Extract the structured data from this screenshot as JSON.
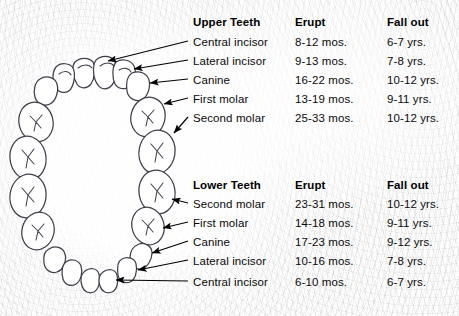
{
  "meta": {
    "colors": {
      "text": "#000000",
      "tooth_outline": "#3a3a46",
      "arrow": "#000000",
      "background": "#fdfdfd"
    }
  },
  "upper": {
    "headers": {
      "teeth": "Upper Teeth",
      "erupt": "Erupt",
      "fall_out": "Fall out"
    },
    "rows": [
      {
        "tooth": "Central incisor",
        "erupt": "8-12 mos.",
        "fall_out": "6-7 yrs."
      },
      {
        "tooth": "Lateral incisor",
        "erupt": "9-13 mos.",
        "fall_out": "7-8 yrs."
      },
      {
        "tooth": "Canine",
        "erupt": "16-22 mos.",
        "fall_out": "10-12 yrs."
      },
      {
        "tooth": "First molar",
        "erupt": "13-19 mos.",
        "fall_out": "9-11 yrs."
      },
      {
        "tooth": "Second molar",
        "erupt": "25-33 mos.",
        "fall_out": "10-12 yrs."
      }
    ]
  },
  "lower": {
    "headers": {
      "teeth": "Lower Teeth",
      "erupt": "Erupt",
      "fall_out": "Fall out"
    },
    "rows": [
      {
        "tooth": "Second molar",
        "erupt": "23-31 mos.",
        "fall_out": "10-12 yrs."
      },
      {
        "tooth": "First molar",
        "erupt": "14-18 mos.",
        "fall_out": "9-11 yrs."
      },
      {
        "tooth": "Canine",
        "erupt": "17-23 mos.",
        "fall_out": "9-12 yrs."
      },
      {
        "tooth": "Lateral incisor",
        "erupt": "10-16 mos.",
        "fall_out": "7-8 yrs."
      },
      {
        "tooth": "Central incisor",
        "erupt": "6-10 mos.",
        "fall_out": "6-7 yrs."
      }
    ]
  },
  "diagram": {
    "upper_arch_label": "upper dental arch",
    "lower_arch_label": "lower dental arch",
    "upper_tooth_count": 10,
    "lower_tooth_count": 10
  }
}
